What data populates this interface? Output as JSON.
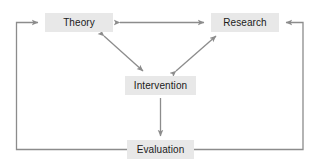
{
  "diagram": {
    "type": "flow-diagram",
    "colors": {
      "box_fill": "#e8e8e8",
      "text": "#1a1a1a",
      "arrow": "#8c8c8c",
      "background": "#ffffff"
    },
    "nodes": [
      {
        "id": "theory",
        "label": "Theory"
      },
      {
        "id": "research",
        "label": "Research"
      },
      {
        "id": "intervention",
        "label": "Intervention"
      },
      {
        "id": "evaluation",
        "label": "Evaluation"
      }
    ],
    "edges": [
      {
        "from": "theory",
        "to": "research",
        "style": "double-headed-horizontal"
      },
      {
        "from": "theory",
        "to": "intervention",
        "style": "double-headed-diagonal"
      },
      {
        "from": "intervention",
        "to": "research",
        "style": "double-headed-diagonal"
      },
      {
        "from": "intervention",
        "to": "evaluation",
        "style": "single-headed-vertical"
      },
      {
        "from": "evaluation",
        "to": "theory",
        "style": "feedback-loop-left"
      },
      {
        "from": "evaluation",
        "to": "research",
        "style": "feedback-loop-right"
      }
    ]
  }
}
